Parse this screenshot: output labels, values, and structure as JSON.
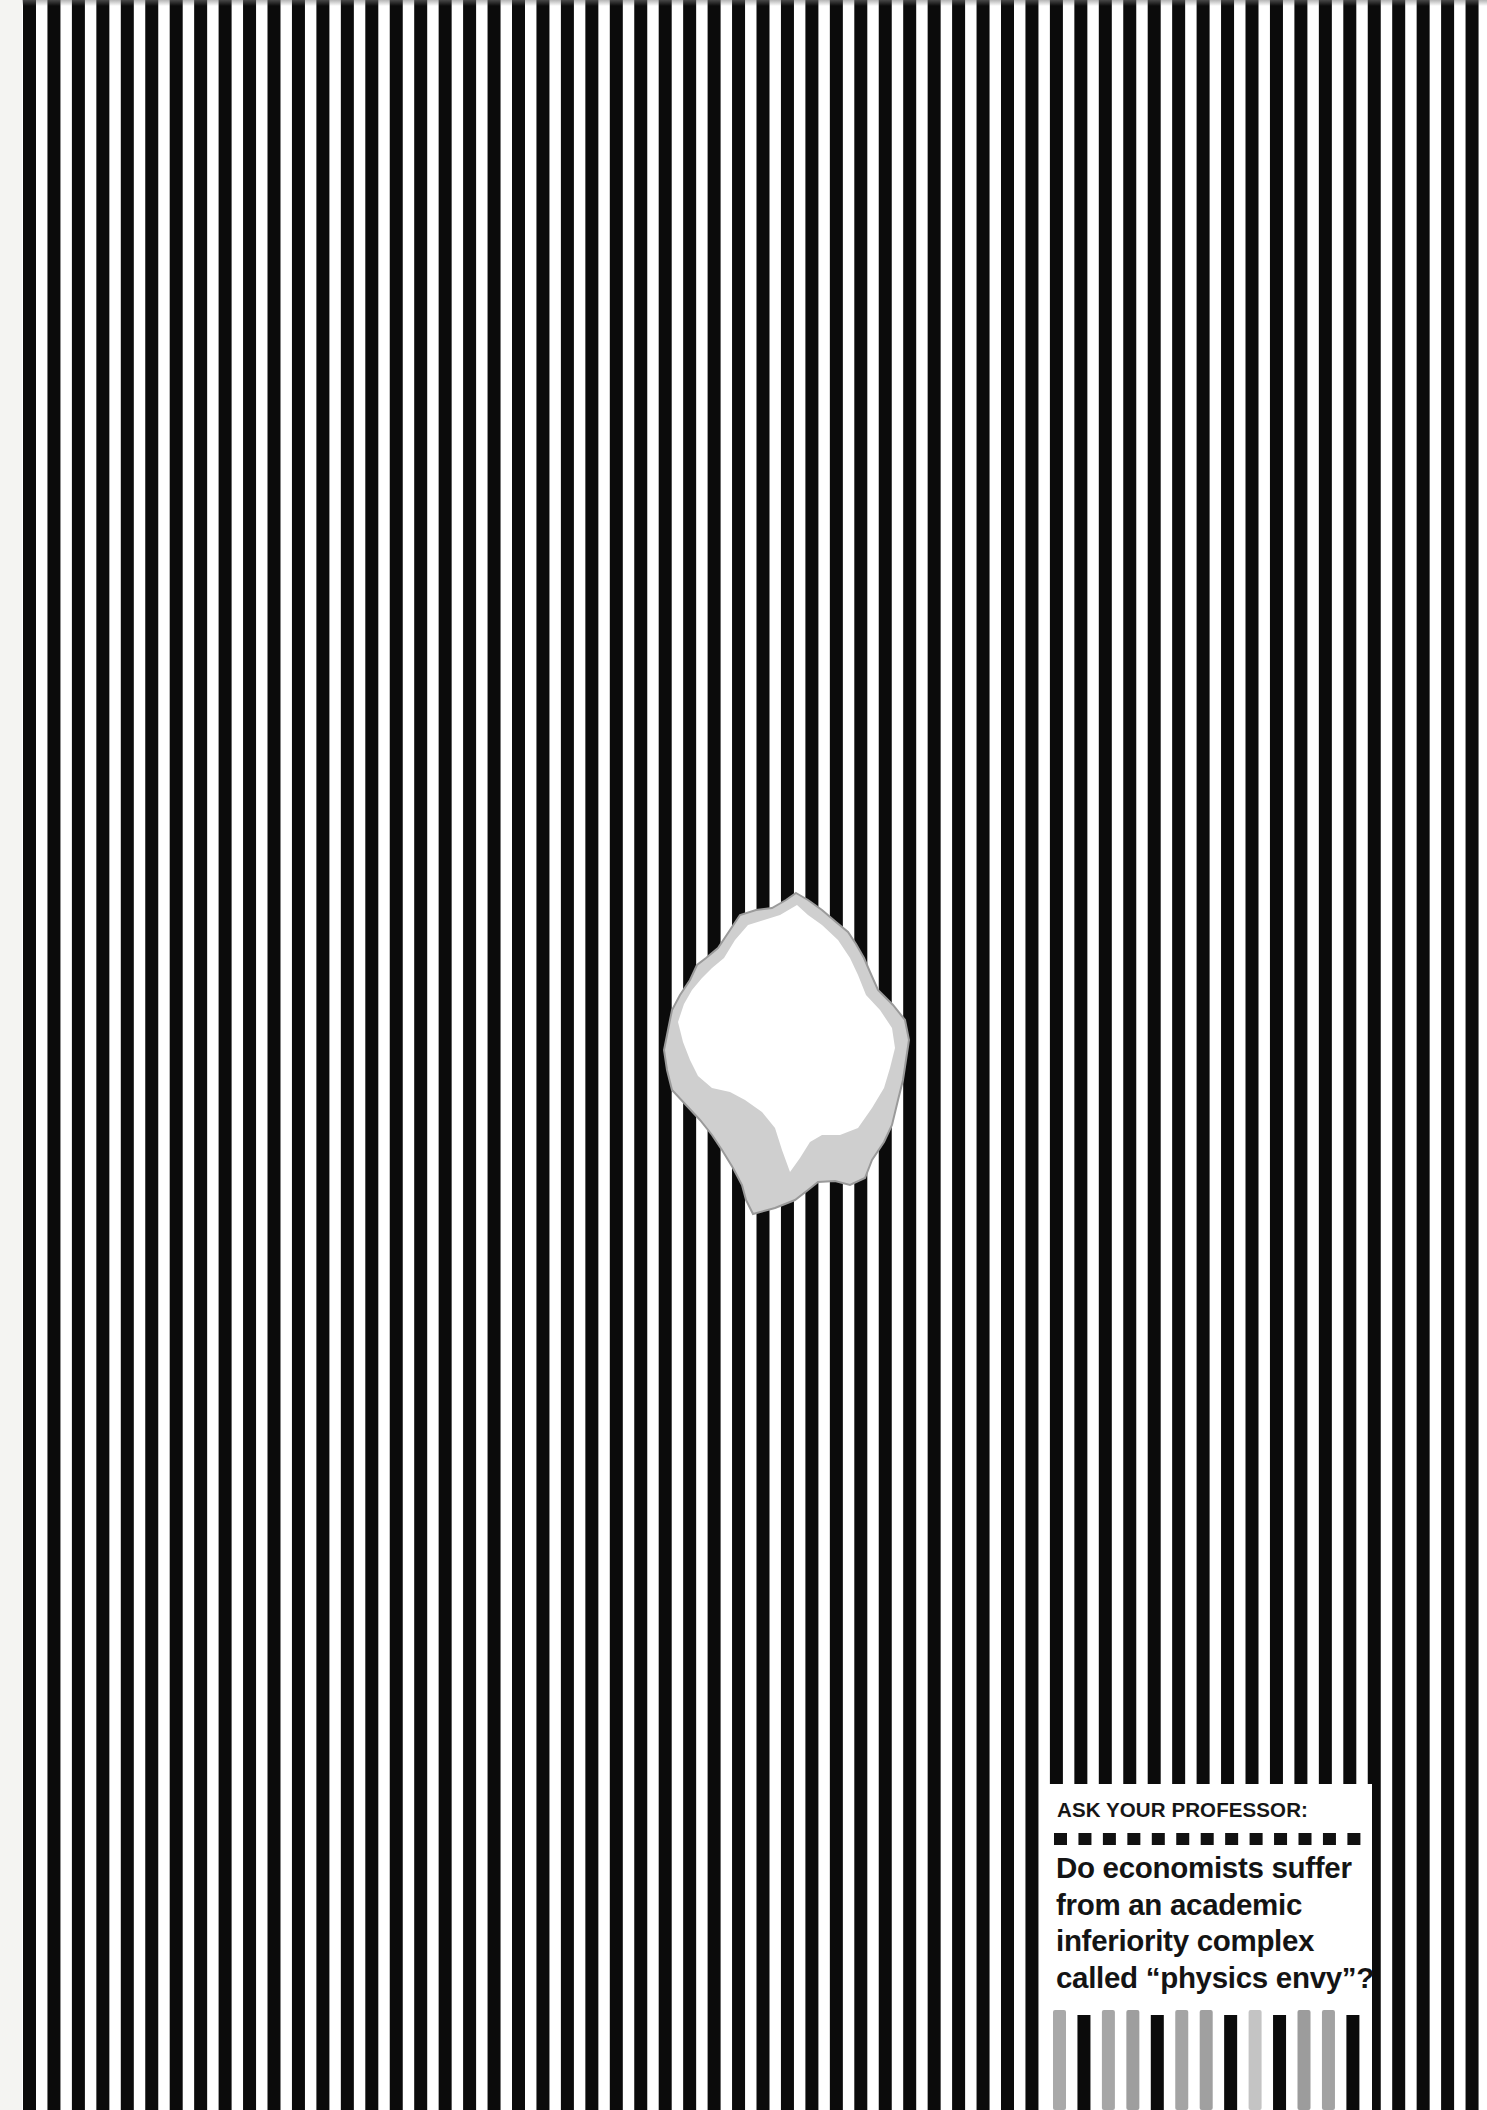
{
  "poster": {
    "background_color": "#f4f4f2",
    "stripe_color": "#0b0b0b",
    "stripe_gap_color": "#ffffff",
    "stripe_start_x": 23,
    "stripe_period": 24.45,
    "stripe_width": 13,
    "hole_fill_color": "#ffffff",
    "hole_edge_color": "#c9c9c9"
  },
  "question_box": {
    "kicker": "ASK YOUR PROFESSOR:",
    "square_count": 13,
    "question_lines": [
      "Do economists suffer",
      "from an academic",
      "inferiority complex",
      "called “physics envy”?"
    ],
    "bottom_bar_colors": [
      "#a9a9a9",
      "#0b0b0b",
      "#a6a6a6",
      "#9e9e9e",
      "#0b0b0b",
      "#a4a4a4",
      "#a0a0a0",
      "#0b0b0b",
      "#c4c4c4",
      "#0b0b0b",
      "#9c9c9c",
      "#a2a2a2",
      "#0b0b0b"
    ]
  }
}
